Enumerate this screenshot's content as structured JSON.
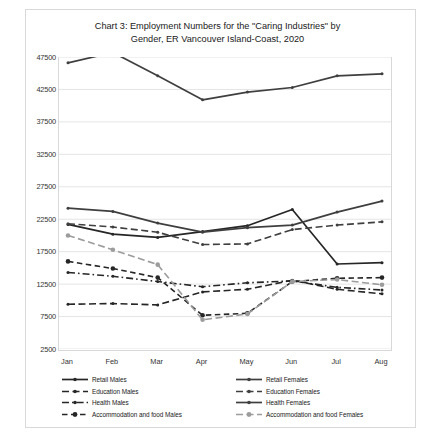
{
  "figure": {
    "background": "#ffffff",
    "frame_color": "#d9d9d9"
  },
  "chart_data": {
    "type": "line",
    "title": "Chart 3: Employment Numbers for the \"Caring Industries\" by Gender, ER Vancouver Island-Coast, 2020",
    "title_line1": "Chart 3: Employment Numbers for the \"Caring Industries\" by",
    "title_line2": "Gender, ER Vancouver Island-Coast, 2020",
    "xlabel": "",
    "ylabel": "",
    "categories": [
      "Jan",
      "Feb",
      "Mar",
      "Apr",
      "May",
      "Jun",
      "Jul",
      "Aug"
    ],
    "ylim": [
      2500,
      47500
    ],
    "yticks": [
      2500,
      7500,
      12500,
      17500,
      22500,
      27500,
      32500,
      37500,
      42500,
      47500
    ],
    "ytick_labels": [
      "2500",
      "7500",
      "12500",
      "17500",
      "22500",
      "27500",
      "32500",
      "37500",
      "42500",
      "47500"
    ],
    "grid": true,
    "grid_color": "#e4e4e4",
    "legend_position": "bottom",
    "legend_columns": 2,
    "series": [
      {
        "name": "Retail Males",
        "color": "#262626",
        "style": "solid",
        "marker": "dot",
        "values": [
          21700,
          20200,
          19700,
          20600,
          21500,
          24000,
          15600,
          15800
        ]
      },
      {
        "name": "Education Males",
        "color": "#262626",
        "style": "dashed",
        "marker": "dot",
        "values": [
          9400,
          9500,
          9300,
          11300,
          11700,
          13100,
          11700,
          11000
        ]
      },
      {
        "name": "Health Males",
        "color": "#262626",
        "style": "dashdot",
        "marker": "dot",
        "values": [
          14300,
          13700,
          12900,
          12100,
          12700,
          13000,
          12000,
          11600
        ]
      },
      {
        "name": "Accommodation and food Males",
        "color": "#262626",
        "style": "dashed-fine",
        "marker": "dot-large",
        "values": [
          16000,
          14900,
          13500,
          7700,
          8000,
          12900,
          13400,
          13500
        ]
      },
      {
        "name": "Retail Females",
        "color": "#3f3f3f",
        "style": "solid",
        "marker": "dot",
        "values": [
          24200,
          23700,
          21900,
          20500,
          21200,
          21600,
          23600,
          25300
        ]
      },
      {
        "name": "Education Females",
        "color": "#3f3f3f",
        "style": "dashed",
        "marker": "dash",
        "values": [
          21800,
          21300,
          20500,
          18600,
          18700,
          20900,
          21600,
          22100
        ]
      },
      {
        "name": "Health Females",
        "color": "#3f3f3f",
        "style": "solid",
        "marker": "dot",
        "values": [
          46600,
          48200,
          44600,
          40900,
          42100,
          42800,
          44600,
          44900
        ]
      },
      {
        "name": "Accommodation and food Females",
        "color": "#9c9c9c",
        "style": "dashed",
        "marker": "dot-large",
        "values": [
          20000,
          17800,
          15500,
          7000,
          7900,
          12900,
          13200,
          12400
        ]
      }
    ]
  },
  "legend": {
    "left_column": [
      "Retail Males",
      "Education Males",
      "Health Males",
      "Accommodation and food Males"
    ],
    "right_column": [
      "Retail Females",
      "Education Females",
      "Health Females",
      "Accommodation and food Females"
    ]
  }
}
